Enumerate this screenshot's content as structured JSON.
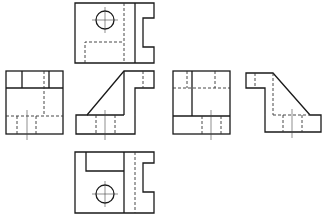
{
  "diagram": {
    "type": "orthographic-projection",
    "title": "",
    "views": [
      {
        "id": "top-view",
        "label": "Top view"
      },
      {
        "id": "left-view",
        "label": "Left side view"
      },
      {
        "id": "front-view",
        "label": "Front view"
      },
      {
        "id": "right-view",
        "label": "Right side view"
      },
      {
        "id": "rear-view",
        "label": "Rear view"
      },
      {
        "id": "bottom-view",
        "label": "Bottom view"
      }
    ],
    "line_types": {
      "solid": "visible edge",
      "dashed": "hidden edge",
      "thin": "center line"
    },
    "colors": {
      "line": "#1a1a1a",
      "background": "#ffffff"
    }
  }
}
